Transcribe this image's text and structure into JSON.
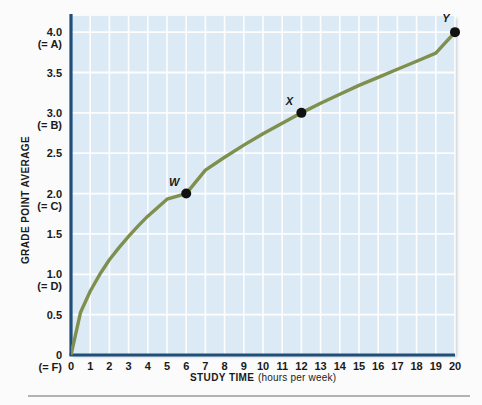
{
  "chart_data": {
    "type": "line",
    "title": "",
    "xlabel": "STUDY TIME",
    "xlabel_sub": "(hours per week)",
    "ylabel": "GRADE POINT AVERAGE",
    "xlim": [
      0,
      20
    ],
    "ylim": [
      0,
      4.2
    ],
    "grid": true,
    "legend": "none",
    "plot_bg_color": "#dceaf5",
    "grid_color": "#ffffff",
    "axis_color": "#1f4e79",
    "curve_color": "#7f8f4e",
    "point_color": "#111111",
    "x_ticks": [
      "0",
      "1",
      "2",
      "3",
      "4",
      "5",
      "6",
      "7",
      "8",
      "9",
      "10",
      "11",
      "12",
      "13",
      "14",
      "15",
      "16",
      "17",
      "18",
      "19",
      "20"
    ],
    "x_tick_values": [
      0,
      1,
      2,
      3,
      4,
      5,
      6,
      7,
      8,
      9,
      10,
      11,
      12,
      13,
      14,
      15,
      16,
      17,
      18,
      19,
      20
    ],
    "y_ticks": [
      {
        "value": 4.0,
        "label": "4.0",
        "sub": "(= A)"
      },
      {
        "value": 3.5,
        "label": "3.5",
        "sub": ""
      },
      {
        "value": 3.0,
        "label": "3.0",
        "sub": "(= B)"
      },
      {
        "value": 2.5,
        "label": "2.5",
        "sub": ""
      },
      {
        "value": 2.0,
        "label": "2.0",
        "sub": "(= C)"
      },
      {
        "value": 1.5,
        "label": "1.5",
        "sub": ""
      },
      {
        "value": 1.0,
        "label": "1.0",
        "sub": "(= D)"
      },
      {
        "value": 0.5,
        "label": "0.5",
        "sub": ""
      },
      {
        "value": 0.0,
        "label": "0",
        "sub": "(= F)"
      }
    ],
    "series": [
      {
        "name": "GPA vs study time",
        "x": [
          0,
          0.5,
          1,
          1.5,
          2,
          2.5,
          3,
          3.5,
          4,
          5,
          6,
          7,
          8,
          9,
          10,
          11,
          12,
          13,
          14,
          15,
          16,
          17,
          18,
          19,
          20
        ],
        "y": [
          0,
          0.53,
          0.79,
          1.0,
          1.18,
          1.33,
          1.47,
          1.6,
          1.72,
          1.93,
          2.0,
          2.29,
          2.45,
          2.6,
          2.74,
          2.87,
          3.0,
          3.12,
          3.23,
          3.34,
          3.44,
          3.54,
          3.64,
          3.74,
          4.0
        ]
      }
    ],
    "points": [
      {
        "label": "W",
        "x": 6,
        "y": 2.0,
        "label_dx": -12,
        "label_dy": -8
      },
      {
        "label": "X",
        "x": 12,
        "y": 3.0,
        "label_dx": -12,
        "label_dy": -8
      },
      {
        "label": "Y",
        "x": 20,
        "y": 4.0,
        "label_dx": -9,
        "label_dy": -10
      }
    ]
  }
}
